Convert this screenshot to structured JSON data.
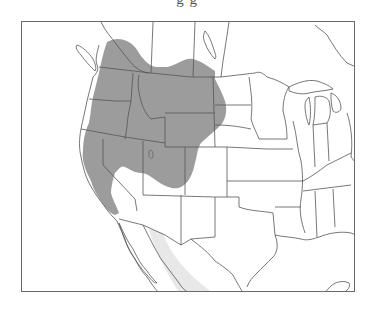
{
  "caption": {
    "visible_fragment": "g   g"
  },
  "map": {
    "region": "Western and Central North America",
    "legend": [],
    "colors": {
      "range_primary": "#9c9c9c",
      "range_secondary": "#e8e8e8",
      "boundary_lines": "#555555",
      "background": "#ffffff",
      "frame": "#6a6a6a"
    },
    "layers": [
      {
        "name": "primary-range",
        "description": "dark gray shaded range covering western US interior and southern British Columbia/Alberta"
      },
      {
        "name": "secondary-range",
        "description": "light gray band along western mainland Mexico coast"
      }
    ]
  }
}
